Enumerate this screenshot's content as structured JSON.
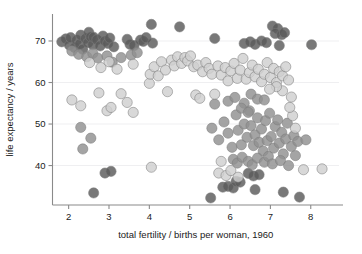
{
  "chart_data": {
    "type": "scatter",
    "title": "",
    "xlabel": "total fertility / births per woman, 1960",
    "ylabel": "life expectancy / years",
    "xlim": [
      1.6,
      8.7
    ],
    "ylim": [
      30.5,
      76.5
    ],
    "xticks": [
      2,
      3,
      4,
      5,
      6,
      7,
      8
    ],
    "yticks": [
      40,
      50,
      60,
      70
    ],
    "grid": "horizontal",
    "grid_color": "#efeff1",
    "legend": "none",
    "marker": "circle",
    "marker_radius": 5.1,
    "marker_opacity": 0.82,
    "marker_stroke": "#7d7d7d",
    "background": "#ffffff",
    "axis_color": "#8a8a8a",
    "series": [
      {
        "name": "dark-group",
        "color": "#5a5a5a",
        "points": [
          [
            1.83,
            69.8
          ],
          [
            1.93,
            70.5
          ],
          [
            2.02,
            69.0
          ],
          [
            2.05,
            70.8
          ],
          [
            2.15,
            68.4
          ],
          [
            2.2,
            70.2
          ],
          [
            2.28,
            69.3
          ],
          [
            2.3,
            71.4
          ],
          [
            2.35,
            68.0
          ],
          [
            2.42,
            70.6
          ],
          [
            2.48,
            69.6
          ],
          [
            2.5,
            72.1
          ],
          [
            2.55,
            71.0
          ],
          [
            2.6,
            69.1
          ],
          [
            2.62,
            70.9
          ],
          [
            2.7,
            70.3
          ],
          [
            2.78,
            68.8
          ],
          [
            2.85,
            71.2
          ],
          [
            2.9,
            70.0
          ],
          [
            2.97,
            69.4
          ],
          [
            3.02,
            70.7
          ],
          [
            3.12,
            68.6
          ],
          [
            3.45,
            70.4
          ],
          [
            3.52,
            69.2
          ],
          [
            3.62,
            68.9
          ],
          [
            3.78,
            70.2
          ],
          [
            3.85,
            69.9
          ],
          [
            3.92,
            70.8
          ],
          [
            4.05,
            74.0
          ],
          [
            4.08,
            69.5
          ],
          [
            4.75,
            73.4
          ],
          [
            5.62,
            70.6
          ],
          [
            6.35,
            69.4
          ],
          [
            6.5,
            69.8
          ],
          [
            6.62,
            69.2
          ],
          [
            6.78,
            70.0
          ],
          [
            6.9,
            69.6
          ],
          [
            7.05,
            73.6
          ],
          [
            7.18,
            73.0
          ],
          [
            7.12,
            71.8
          ],
          [
            7.28,
            71.5
          ],
          [
            7.35,
            72.0
          ],
          [
            7.22,
            68.9
          ],
          [
            8.02,
            69.1
          ],
          [
            2.62,
            33.4
          ],
          [
            2.9,
            38.2
          ],
          [
            3.05,
            38.6
          ],
          [
            5.52,
            32.2
          ],
          [
            5.82,
            34.8
          ],
          [
            5.95,
            35.0
          ],
          [
            6.08,
            34.6
          ],
          [
            6.45,
            38.1
          ],
          [
            6.58,
            37.5
          ],
          [
            6.62,
            34.2
          ],
          [
            6.72,
            37.8
          ],
          [
            7.32,
            33.6
          ],
          [
            7.72,
            32.4
          ],
          [
            6.15,
            36.2
          ],
          [
            6.25,
            36.0
          ]
        ]
      },
      {
        "name": "mid-dark-group",
        "color": "#909090",
        "points": [
          [
            2.08,
            67.6
          ],
          [
            2.25,
            66.8
          ],
          [
            2.45,
            66.2
          ],
          [
            2.6,
            67.0
          ],
          [
            2.72,
            65.9
          ],
          [
            2.95,
            66.4
          ],
          [
            3.08,
            64.9
          ],
          [
            3.3,
            66.0
          ],
          [
            3.55,
            66.6
          ],
          [
            3.7,
            67.2
          ],
          [
            2.35,
            44.0
          ],
          [
            2.3,
            49.2
          ],
          [
            2.55,
            46.6
          ],
          [
            5.55,
            49.0
          ],
          [
            5.72,
            46.2
          ],
          [
            5.85,
            50.5
          ],
          [
            5.95,
            47.8
          ],
          [
            6.05,
            44.4
          ],
          [
            6.15,
            52.2
          ],
          [
            6.2,
            48.5
          ],
          [
            6.28,
            45.0
          ],
          [
            6.35,
            50.0
          ],
          [
            6.42,
            46.8
          ],
          [
            6.48,
            53.2
          ],
          [
            6.52,
            49.6
          ],
          [
            6.58,
            44.8
          ],
          [
            6.62,
            47.4
          ],
          [
            6.68,
            51.5
          ],
          [
            6.72,
            45.6
          ],
          [
            6.78,
            48.8
          ],
          [
            6.82,
            43.5
          ],
          [
            6.88,
            50.8
          ],
          [
            6.92,
            46.0
          ],
          [
            6.98,
            52.6
          ],
          [
            7.02,
            47.0
          ],
          [
            7.08,
            44.2
          ],
          [
            7.12,
            49.4
          ],
          [
            7.18,
            51.0
          ],
          [
            7.22,
            45.4
          ],
          [
            7.28,
            48.0
          ],
          [
            7.32,
            42.8
          ],
          [
            7.38,
            46.4
          ],
          [
            7.42,
            50.2
          ],
          [
            6.08,
            41.5
          ],
          [
            6.18,
            40.6
          ],
          [
            6.3,
            42.0
          ],
          [
            6.45,
            41.0
          ],
          [
            6.55,
            40.2
          ],
          [
            6.68,
            41.8
          ],
          [
            6.85,
            40.8
          ],
          [
            6.95,
            42.2
          ],
          [
            7.05,
            40.4
          ],
          [
            7.25,
            41.2
          ],
          [
            7.45,
            40.0
          ],
          [
            7.52,
            44.6
          ],
          [
            7.58,
            47.2
          ],
          [
            7.62,
            42.4
          ],
          [
            7.68,
            45.8
          ],
          [
            7.88,
            46.2
          ],
          [
            5.62,
            54.8
          ],
          [
            5.95,
            55.5
          ],
          [
            6.12,
            56.4
          ],
          [
            6.35,
            55.0
          ],
          [
            6.52,
            57.2
          ],
          [
            6.68,
            56.0
          ],
          [
            6.85,
            55.8
          ],
          [
            6.28,
            53.8
          ],
          [
            6.45,
            52.8
          ]
        ]
      },
      {
        "name": "light-group",
        "color": "#cfcfcf",
        "points": [
          [
            2.08,
            55.8
          ],
          [
            2.3,
            54.4
          ],
          [
            2.75,
            57.5
          ],
          [
            2.95,
            53.2
          ],
          [
            3.05,
            54.0
          ],
          [
            3.3,
            57.3
          ],
          [
            3.45,
            55.2
          ],
          [
            3.6,
            52.8
          ],
          [
            2.52,
            64.8
          ],
          [
            2.8,
            63.6
          ],
          [
            3.0,
            65.0
          ],
          [
            3.2,
            63.2
          ],
          [
            3.6,
            64.4
          ],
          [
            4.0,
            59.8
          ],
          [
            4.02,
            62.0
          ],
          [
            4.12,
            63.8
          ],
          [
            4.22,
            61.6
          ],
          [
            4.3,
            65.0
          ],
          [
            4.4,
            63.0
          ],
          [
            4.45,
            57.8
          ],
          [
            4.55,
            65.4
          ],
          [
            4.62,
            64.0
          ],
          [
            4.7,
            66.2
          ],
          [
            4.8,
            64.6
          ],
          [
            4.88,
            66.0
          ],
          [
            4.95,
            65.2
          ],
          [
            5.02,
            66.4
          ],
          [
            5.1,
            63.8
          ],
          [
            5.15,
            57.0
          ],
          [
            5.2,
            64.2
          ],
          [
            5.25,
            56.2
          ],
          [
            5.32,
            62.6
          ],
          [
            5.4,
            64.8
          ],
          [
            5.48,
            63.4
          ],
          [
            5.55,
            62.0
          ],
          [
            5.62,
            57.2
          ],
          [
            5.7,
            64.0
          ],
          [
            5.78,
            61.8
          ],
          [
            5.88,
            63.6
          ],
          [
            5.95,
            60.4
          ],
          [
            6.02,
            62.8
          ],
          [
            6.1,
            64.6
          ],
          [
            6.18,
            61.0
          ],
          [
            6.25,
            63.0
          ],
          [
            6.32,
            65.8
          ],
          [
            6.4,
            60.8
          ],
          [
            6.48,
            62.4
          ],
          [
            6.55,
            64.2
          ],
          [
            6.62,
            61.4
          ],
          [
            6.7,
            63.2
          ],
          [
            6.78,
            60.2
          ],
          [
            6.85,
            62.0
          ],
          [
            6.92,
            64.8
          ],
          [
            7.0,
            61.2
          ],
          [
            7.08,
            63.4
          ],
          [
            7.15,
            60.0
          ],
          [
            7.22,
            62.6
          ],
          [
            7.3,
            61.6
          ],
          [
            7.38,
            63.8
          ],
          [
            7.45,
            60.6
          ],
          [
            4.05,
            39.6
          ],
          [
            7.82,
            39.0
          ],
          [
            8.28,
            39.2
          ],
          [
            7.55,
            52.0
          ],
          [
            7.62,
            49.0
          ],
          [
            5.72,
            38.2
          ],
          [
            5.9,
            37.6
          ],
          [
            6.02,
            38.8
          ],
          [
            6.2,
            37.2
          ],
          [
            5.78,
            41.0
          ],
          [
            7.48,
            54.0
          ],
          [
            7.52,
            56.5
          ],
          [
            7.3,
            58.0
          ],
          [
            7.15,
            59.0
          ],
          [
            6.98,
            58.4
          ]
        ]
      }
    ]
  },
  "axes": {
    "x_tick_labels": [
      "2",
      "3",
      "4",
      "5",
      "6",
      "7",
      "8"
    ],
    "y_tick_labels": [
      "40",
      "50",
      "60",
      "70"
    ],
    "x_title": "total fertility / births per woman, 1960",
    "y_title": "life expectancy / years"
  }
}
